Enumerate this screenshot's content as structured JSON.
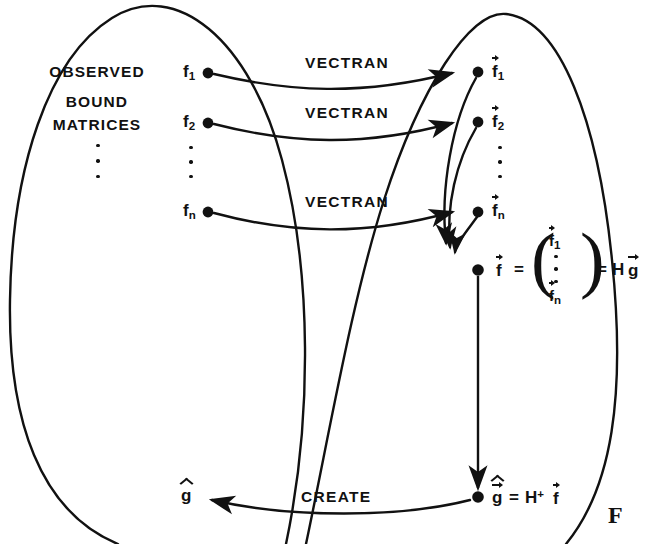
{
  "figure": {
    "background_color": "#ffffff",
    "ink_color": "#111111",
    "width": 646,
    "height": 544
  },
  "sets": {
    "left": {
      "name": "observed-bound-matrices-set",
      "label_lines": [
        "OBSERVED",
        "BOUND",
        "MATRICES"
      ],
      "ellipsis": "vertical-dots"
    },
    "right": {
      "name": "vector-space-set",
      "label_lines": []
    }
  },
  "left_nodes": [
    {
      "label": "f",
      "subscript": "1"
    },
    {
      "label": "f",
      "subscript": "2"
    },
    {
      "label": "f",
      "subscript": "n"
    }
  ],
  "right_nodes": [
    {
      "label": "f",
      "subscript": "1",
      "accent": "vector"
    },
    {
      "label": "f",
      "subscript": "2",
      "accent": "vector"
    },
    {
      "label": "f",
      "subscript": "n",
      "accent": "vector"
    }
  ],
  "edges": {
    "transform_label": "VECTRAN",
    "transform_count": 3,
    "create_label": "CREATE"
  },
  "equations": {
    "stacked": {
      "lhs": "f",
      "lhs_accent": "vector",
      "equals": "=",
      "matrix_rows": [
        {
          "label": "f",
          "subscript": "1",
          "accent": "vector"
        },
        {
          "label": "⋮",
          "subscript": "",
          "accent": "none"
        },
        {
          "label": "f",
          "subscript": "n",
          "accent": "vector"
        }
      ],
      "equals2": "=",
      "rhs_operator": "H",
      "rhs_operand": "g",
      "rhs_operand_accent": "vector"
    },
    "pseudoinverse": {
      "lhs": "g",
      "lhs_accent": "hat-vector",
      "equals": "=",
      "rhs_operator": "H",
      "rhs_operator_sup": "+",
      "rhs_operand": "f",
      "rhs_operand_accent": "vector"
    }
  },
  "result_node": {
    "label": "g",
    "accent": "hat",
    "name": "g-hat-output"
  },
  "caption": {
    "text": "F"
  }
}
